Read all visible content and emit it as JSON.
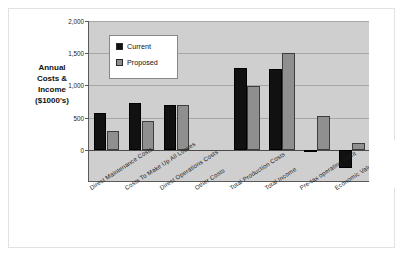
{
  "axis_title": {
    "lines": [
      "Annual",
      "Costs &",
      "Income",
      "($1000's)"
    ]
  },
  "legend": {
    "entries": [
      {
        "label": "Current",
        "color": "#111111"
      },
      {
        "label": "Proposed",
        "color": "#8f8f8f"
      }
    ]
  },
  "yticks": [
    "0",
    "500",
    "1,000",
    "1,500",
    "2,000"
  ],
  "chart_data": {
    "type": "bar",
    "title": "",
    "subtitle": "",
    "xlabel": "",
    "ylabel": "Annual Costs & Income ($1000's)",
    "ylim": [
      -500,
      2000
    ],
    "ytick_values": [
      0,
      500,
      1000,
      1500,
      2000
    ],
    "ytick_labels": [
      "0",
      "500",
      "1,000",
      "1,500",
      "2,000"
    ],
    "grid": true,
    "legend_position": "upper-left-inside",
    "categories": [
      "Direct Maintenance Costs",
      "Costs To Make Up All Losses",
      "Direct Operations Costs",
      "Other Costs",
      "Total Production Costs",
      "Total Income",
      "Pre-tax operating profit",
      "Economic Value A"
    ],
    "series": [
      {
        "name": "Current",
        "color": "#111111",
        "values": [
          570,
          720,
          700,
          0,
          1270,
          1250,
          -20,
          -280
        ]
      },
      {
        "name": "Proposed",
        "color": "#8f8f8f",
        "values": [
          290,
          450,
          700,
          0,
          990,
          1510,
          520,
          110
        ]
      }
    ]
  },
  "colors": {
    "plot_background": "#cfcfcf",
    "figure_background": "#ffffff",
    "gridline": "#a6a6a6",
    "axis": "#5a5a5a",
    "current": "#111111",
    "proposed": "#8f8f8f"
  }
}
